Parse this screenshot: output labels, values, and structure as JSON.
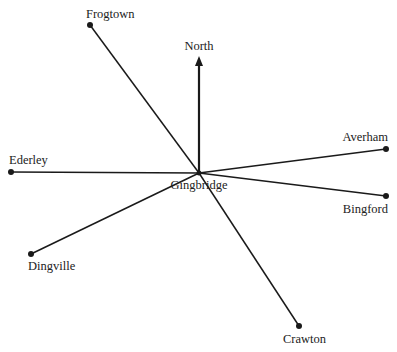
{
  "diagram": {
    "type": "compass-bearing-map",
    "center": {
      "name": "Gingbridge",
      "x": 199,
      "y": 173
    },
    "north_label": "North",
    "north_arrow": {
      "x1": 199,
      "y1": 173,
      "x2": 199,
      "y2": 56
    },
    "towns": [
      {
        "name": "Frogtown",
        "x": 90,
        "y": 25,
        "label_x": 86,
        "label_y": 18
      },
      {
        "name": "Ederley",
        "x": 11,
        "y": 172,
        "label_x": 9,
        "label_y": 164
      },
      {
        "name": "Averham",
        "x": 386,
        "y": 149,
        "label_x": 388,
        "label_y": 141
      },
      {
        "name": "Bingford",
        "x": 386,
        "y": 196,
        "label_x": 388,
        "label_y": 213
      },
      {
        "name": "Dingville",
        "x": 31,
        "y": 254,
        "label_x": 28,
        "label_y": 270
      },
      {
        "name": "Crawton",
        "x": 299,
        "y": 326,
        "label_x": 283,
        "label_y": 343
      }
    ],
    "colors": {
      "line": "#1a1a1a",
      "text": "#222222",
      "background": "#ffffff"
    }
  }
}
